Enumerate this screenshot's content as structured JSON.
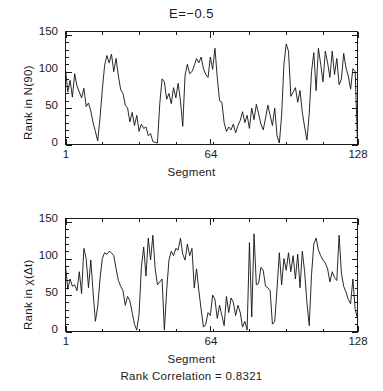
{
  "figure": {
    "title": "E=−0.5",
    "caption": "Rank Correlation = 0.8321",
    "background": "#ffffff",
    "line_color": "#111111",
    "axis_color": "#1a1a1a"
  },
  "panels": {
    "top": {
      "ylabel": "Rank in N(90)",
      "xlabel": "Segment",
      "ytick_labels": [
        "0",
        "50",
        "100",
        "150"
      ],
      "xtick_labels": [
        "1",
        "64",
        "128"
      ]
    },
    "bottom": {
      "ylabel": "Rank in χ(Δt)",
      "xlabel": "Segment",
      "ytick_labels": [
        "0",
        "50",
        "100",
        "150"
      ],
      "xtick_labels": [
        "1",
        "64",
        "128"
      ]
    }
  },
  "chart_data": [
    {
      "type": "line",
      "title": "E=−0.5",
      "xlabel": "Segment",
      "ylabel": "Rank in N(90)",
      "xlim": [
        1,
        128
      ],
      "ylim": [
        0,
        155
      ],
      "yticks": [
        0,
        50,
        100,
        150
      ],
      "xticks": [
        1,
        64,
        128
      ],
      "grid": false,
      "legend": null,
      "x": [
        1,
        2,
        3,
        4,
        5,
        6,
        7,
        8,
        9,
        10,
        11,
        12,
        13,
        14,
        15,
        16,
        17,
        18,
        19,
        20,
        21,
        22,
        23,
        24,
        25,
        26,
        27,
        28,
        29,
        30,
        31,
        32,
        33,
        34,
        35,
        36,
        37,
        38,
        39,
        40,
        41,
        42,
        43,
        44,
        45,
        46,
        47,
        48,
        49,
        50,
        51,
        52,
        53,
        54,
        55,
        56,
        57,
        58,
        59,
        60,
        61,
        62,
        63,
        64,
        65,
        66,
        67,
        68,
        69,
        70,
        71,
        72,
        73,
        74,
        75,
        76,
        77,
        78,
        79,
        80,
        81,
        82,
        83,
        84,
        85,
        86,
        87,
        88,
        89,
        90,
        91,
        92,
        93,
        94,
        95,
        96,
        97,
        98,
        99,
        100,
        101,
        102,
        103,
        104,
        105,
        106,
        107,
        108,
        109,
        110,
        111,
        112,
        113,
        114,
        115,
        116,
        117,
        118,
        119,
        120,
        121,
        122,
        123,
        124,
        125,
        126,
        127,
        128
      ],
      "values": [
        103,
        72,
        88,
        65,
        97,
        80,
        72,
        64,
        77,
        52,
        57,
        46,
        30,
        18,
        5,
        36,
        75,
        108,
        122,
        112,
        124,
        100,
        118,
        94,
        75,
        70,
        54,
        50,
        31,
        44,
        26,
        40,
        18,
        28,
        22,
        24,
        12,
        15,
        4,
        3,
        2,
        56,
        90,
        86,
        62,
        70,
        56,
        78,
        64,
        84,
        60,
        25,
        95,
        110,
        97,
        100,
        108,
        118,
        112,
        120,
        104,
        96,
        92,
        120,
        103,
        132,
        92,
        60,
        58,
        30,
        18,
        24,
        20,
        28,
        16,
        26,
        33,
        45,
        30,
        40,
        22,
        50,
        34,
        55,
        42,
        28,
        20,
        36,
        54,
        40,
        26,
        50,
        12,
        2,
        40,
        110,
        138,
        128,
        66,
        72,
        78,
        58,
        74,
        44,
        24,
        6,
        42,
        100,
        126,
        74,
        132,
        110,
        86,
        128,
        112,
        92,
        128,
        96,
        118,
        82,
        90,
        125,
        105,
        94,
        76,
        104,
        100,
        2
      ]
    },
    {
      "type": "line",
      "title": "",
      "xlabel": "Segment",
      "ylabel": "Rank in χ(Δt)",
      "xlim": [
        1,
        128
      ],
      "ylim": [
        0,
        155
      ],
      "yticks": [
        0,
        50,
        100,
        150
      ],
      "xticks": [
        1,
        64,
        128
      ],
      "grid": false,
      "legend": null,
      "x": [
        1,
        2,
        3,
        4,
        5,
        6,
        7,
        8,
        9,
        10,
        11,
        12,
        13,
        14,
        15,
        16,
        17,
        18,
        19,
        20,
        21,
        22,
        23,
        24,
        25,
        26,
        27,
        28,
        29,
        30,
        31,
        32,
        33,
        34,
        35,
        36,
        37,
        38,
        39,
        40,
        41,
        42,
        43,
        44,
        45,
        46,
        47,
        48,
        49,
        50,
        51,
        52,
        53,
        54,
        55,
        56,
        57,
        58,
        59,
        60,
        61,
        62,
        63,
        64,
        65,
        66,
        67,
        68,
        69,
        70,
        71,
        72,
        73,
        74,
        75,
        76,
        77,
        78,
        79,
        80,
        81,
        82,
        83,
        84,
        85,
        86,
        87,
        88,
        89,
        90,
        91,
        92,
        93,
        94,
        95,
        96,
        97,
        98,
        99,
        100,
        101,
        102,
        103,
        104,
        105,
        106,
        107,
        108,
        109,
        110,
        111,
        112,
        113,
        114,
        115,
        116,
        117,
        118,
        119,
        120,
        121,
        122,
        123,
        124,
        125,
        126,
        127,
        128
      ],
      "values": [
        90,
        58,
        72,
        62,
        64,
        56,
        82,
        52,
        114,
        100,
        60,
        98,
        54,
        14,
        34,
        72,
        100,
        108,
        106,
        110,
        108,
        104,
        86,
        70,
        62,
        56,
        36,
        48,
        42,
        26,
        10,
        2,
        24,
        88,
        116,
        76,
        128,
        98,
        132,
        86,
        64,
        68,
        72,
        2,
        56,
        98,
        110,
        104,
        114,
        112,
        128,
        106,
        98,
        120,
        104,
        114,
        60,
        86,
        56,
        30,
        6,
        10,
        26,
        22,
        50,
        44,
        18,
        36,
        22,
        8,
        48,
        26,
        46,
        40,
        22,
        36,
        26,
        6,
        14,
        2,
        122,
        20,
        134,
        64,
        66,
        88,
        84,
        62,
        60,
        56,
        10,
        14,
        58,
        108,
        64,
        100,
        84,
        108,
        82,
        104,
        72,
        106,
        60,
        110,
        82,
        40,
        8,
        78,
        120,
        128,
        112,
        104,
        98,
        94,
        86,
        68,
        82,
        74,
        70,
        132,
        80,
        62,
        54,
        44,
        38,
        72,
        30,
        18
      ]
    }
  ]
}
